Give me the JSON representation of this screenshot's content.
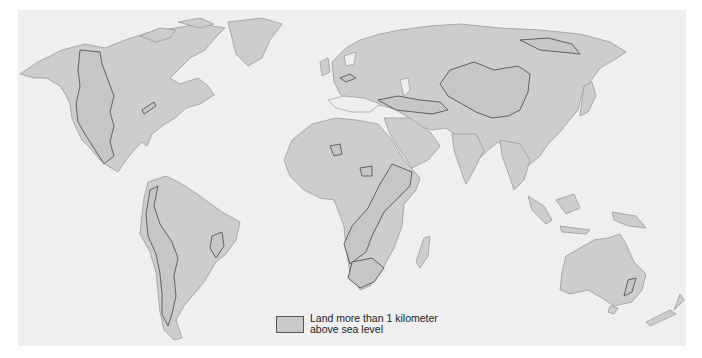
{
  "map": {
    "title": "World map of highlands",
    "colors": {
      "background": "#efefef",
      "land": "#cdcdcd",
      "highland": "#c6c6c6",
      "highland_outline": "#555555",
      "coast_outline": "#9a9a9a"
    },
    "regions": [
      "North America",
      "South America",
      "Europe",
      "Asia",
      "Africa",
      "Australia",
      "Greenland",
      "Madagascar",
      "New Zealand",
      "Indonesia",
      "Japan"
    ]
  },
  "legend": {
    "line1": "Land more than 1 kilometer",
    "line2": "above sea level",
    "swatch_color": "#c9c9c9"
  }
}
